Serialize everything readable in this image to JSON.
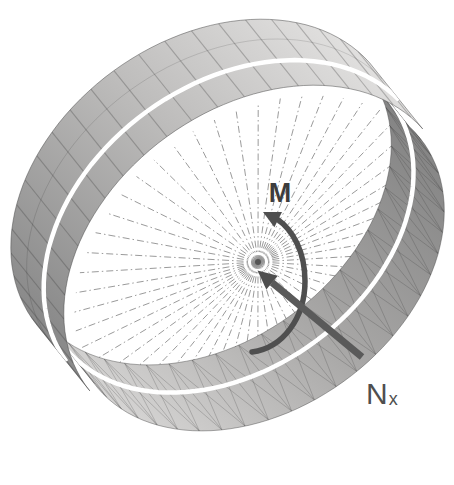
{
  "figure": {
    "labels": {
      "moment": "M",
      "axial_force_main": "N",
      "axial_force_sub": "x"
    },
    "colors": {
      "background": "#ffffff",
      "outer_light": "#e2e1e0",
      "outer_dark": "#8a8a8a",
      "inner_dark": "#7f7f7f",
      "inner_light": "#d8d7d6",
      "stripe": "#ffffff",
      "mesh_line": "rgba(55,55,55,0.30)",
      "inner_mesh_line": "rgba(50,50,50,0.22)",
      "edge_line": "rgba(70,70,70,0.55)",
      "spoke": "#8f8f8f",
      "hub": "#555555",
      "arrow": "#4f4f4f",
      "label": "#3d3d3d"
    },
    "geometry": {
      "rotation_deg": 36,
      "far_center": [
        205,
        196
      ],
      "axis_offset": [
        53,
        66
      ],
      "outer_radii": [
        212,
        155
      ],
      "inner_radii": [
        204,
        147
      ],
      "band_theta": [
        178,
        356
      ],
      "crescent_theta": [
        -8,
        180
      ],
      "outer_stripe_u": 0.62,
      "outer_row_u": 0.3,
      "inner_stripe_u": 0.42,
      "band_mesh_step_deg": 8,
      "crescent_mesh_step_deg": 7.2,
      "spoke_count": 52,
      "spoke_scale": 0.985,
      "stripe_width": 4.5
    },
    "arrows": {
      "moment_shaft": "M 252 352 C 283 348 305 318 305 281 C 305 252 293 230 277 219",
      "moment_head": "263,212 282,212 274.4,227.2",
      "axial_shaft": "M 362 357 L 272 282.5",
      "axial_head": "257.5,270.5 277.9,275.8 266.3,289.6"
    }
  }
}
